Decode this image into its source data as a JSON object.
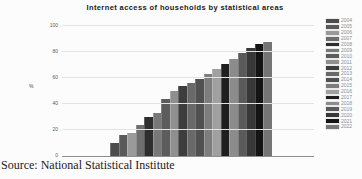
{
  "title": "Internet access of households by statistical areas",
  "source": "Source: National Statistical Institute",
  "chart_data": {
    "type": "bar",
    "title": "Internet access of households by statistical areas",
    "xlabel": "",
    "ylabel": "%",
    "ylim": [
      0,
      100
    ],
    "yticks": [
      0,
      20,
      40,
      60,
      80,
      100
    ],
    "grid": true,
    "legend_position": "right",
    "categories": [
      "2004",
      "2005",
      "2006",
      "2007",
      "2008",
      "2009",
      "2010",
      "2011",
      "2012",
      "2013",
      "2014",
      "2015",
      "2016",
      "2017",
      "2018",
      "2019",
      "2020",
      "2021",
      "2022"
    ],
    "values": [
      10,
      16,
      18,
      24,
      30,
      33,
      44,
      50,
      54,
      56,
      59,
      63,
      67,
      71,
      75,
      79,
      83,
      86,
      88
    ],
    "colors": [
      "#4d4d4d",
      "#595959",
      "#9a9a9a",
      "#6e6e6e",
      "#2e2e2e",
      "#787878",
      "#5c5c5c",
      "#8f8f8f",
      "#3d3d3d",
      "#696969",
      "#505050",
      "#7d7d7d",
      "#a0a0a0",
      "#1f1f1f",
      "#8c8c8c",
      "#5a5a5a",
      "#383838",
      "#141414",
      "#757575"
    ]
  }
}
